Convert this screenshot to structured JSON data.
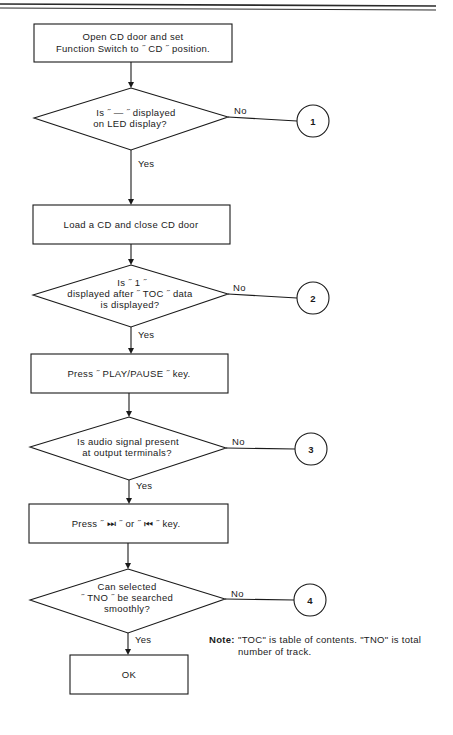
{
  "header": {
    "rule": "double-line"
  },
  "flowchart": {
    "steps": [
      {
        "id": "step1",
        "type": "process",
        "lines": [
          "Open CD door and set",
          "Function Switch to  ˝ CD ˝  position."
        ]
      },
      {
        "id": "dec1",
        "type": "decision",
        "lines": [
          "Is  ˝ — ˝  displayed",
          "on  LED  display?"
        ],
        "yes_label": "Yes",
        "no_label": "No",
        "no_target": "1"
      },
      {
        "id": "step2",
        "type": "process",
        "lines": [
          "Load  a  CD  and  close  CD  door"
        ]
      },
      {
        "id": "dec2",
        "type": "decision",
        "lines": [
          "Is  ˝ 1 ˝",
          "displayed after  ˝ TOC ˝  data",
          "is displayed?"
        ],
        "yes_label": "Yes",
        "no_label": "No",
        "no_target": "2"
      },
      {
        "id": "step3",
        "type": "process",
        "lines": [
          "Press  ˝ PLAY/PAUSE ˝  key."
        ]
      },
      {
        "id": "dec3",
        "type": "decision",
        "lines": [
          "Is audio signal present",
          "at  output  terminals?"
        ],
        "yes_label": "Yes",
        "no_label": "No",
        "no_target": "3"
      },
      {
        "id": "step4",
        "type": "process",
        "lines": [
          "Press  ˝ ⏭ ˝  or  ˝ ⏮ ˝  key."
        ]
      },
      {
        "id": "dec4",
        "type": "decision",
        "lines": [
          "Can  selected",
          "˝ TNO ˝  be  searched",
          "smoothly?"
        ],
        "yes_label": "Yes",
        "no_label": "No",
        "no_target": "4"
      },
      {
        "id": "end",
        "type": "terminal",
        "lines": [
          "OK"
        ]
      }
    ],
    "connectors": [
      "1",
      "2",
      "3",
      "4"
    ]
  },
  "note": {
    "label": "Note:",
    "line1": "\"TOC\" is table of contents. \"TNO\" is total",
    "line2": "number of track."
  }
}
